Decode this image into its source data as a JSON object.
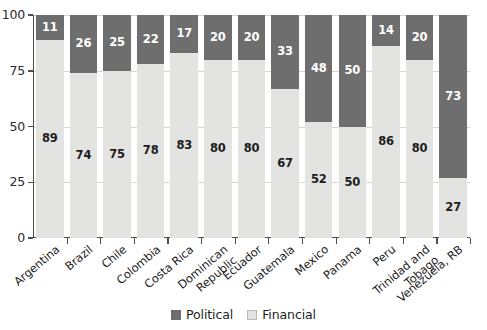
{
  "chart_data": {
    "type": "bar",
    "subtype": "stacked-bar-100",
    "title": "",
    "subtitle": "",
    "xlabel": "",
    "ylabel": "",
    "ylim": [
      0,
      100
    ],
    "yticks": [
      0,
      25,
      50,
      75,
      100
    ],
    "ytick_labels": [
      "0",
      "25",
      "50",
      "75",
      "100"
    ],
    "grid": true,
    "grid_axis": "y",
    "legend_position": "bottom-right",
    "categories": [
      "Argentina",
      "Brazil",
      "Chile",
      "Colombia",
      "Costa Rica",
      "Dominican Republic",
      "Ecuador",
      "Guatemala",
      "Mexico",
      "Panama",
      "Peru",
      "Trinidad and Tobago",
      "Venezuela, RB"
    ],
    "category_labels": [
      "Argentina",
      "Brazil",
      "Chile",
      "Colombia",
      "Costa Rica",
      "Dominican\nRepublic",
      "Ecuador",
      "Guatemala",
      "Mexico",
      "Panama",
      "Peru",
      "Trinidad and\nTobago",
      "Venezuela, RB"
    ],
    "series": [
      {
        "name": "Financial",
        "color": "#e3e3e1",
        "values": [
          89,
          74,
          75,
          78,
          83,
          80,
          80,
          67,
          52,
          50,
          86,
          80,
          27
        ]
      },
      {
        "name": "Political",
        "color": "#6e6e6e",
        "values": [
          11,
          26,
          25,
          22,
          17,
          20,
          20,
          33,
          48,
          50,
          14,
          20,
          73
        ]
      }
    ],
    "stack_order_bottom_to_top": [
      "Financial",
      "Political"
    ]
  },
  "legend": {
    "items": [
      {
        "label": "Political",
        "swatch": "political"
      },
      {
        "label": "Financial",
        "swatch": "financial"
      }
    ]
  },
  "colors": {
    "political": "#6e6e6e",
    "financial": "#e3e3e1",
    "axis": "#4d4d4d",
    "grid": "#d6d6d6",
    "text": "#1d1d1d",
    "background": "#ffffff"
  }
}
